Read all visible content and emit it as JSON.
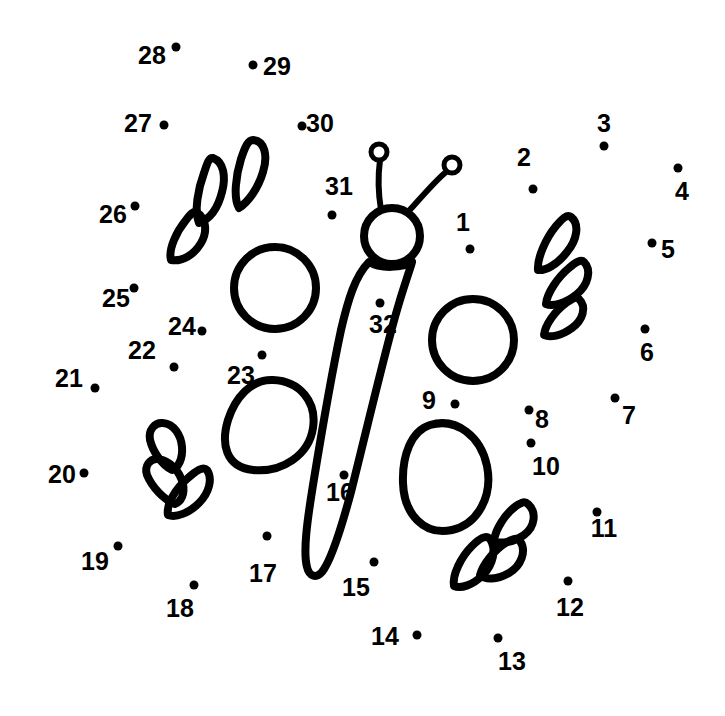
{
  "page": {
    "background_color": "#ffffff",
    "ink_color": "#000000",
    "width": 725,
    "height": 716
  },
  "puzzle": {
    "type": "connect-the-dots",
    "subject": "butterfly",
    "dot_count": 32,
    "dot_radius": 4.5,
    "label_font_size": 25,
    "dots": [
      {
        "n": "1",
        "dx": 470,
        "dy": 249,
        "lx": 463,
        "ly": 222
      },
      {
        "n": "2",
        "dx": 533,
        "dy": 189,
        "lx": 524,
        "ly": 157
      },
      {
        "n": "3",
        "dx": 604,
        "dy": 146,
        "lx": 604,
        "ly": 123
      },
      {
        "n": "4",
        "dx": 678,
        "dy": 168,
        "lx": 682,
        "ly": 191
      },
      {
        "n": "5",
        "dx": 652,
        "dy": 243,
        "lx": 668,
        "ly": 249
      },
      {
        "n": "6",
        "dx": 645,
        "dy": 329,
        "lx": 647,
        "ly": 352
      },
      {
        "n": "7",
        "dx": 615,
        "dy": 398,
        "lx": 629,
        "ly": 415
      },
      {
        "n": "8",
        "dx": 529,
        "dy": 410,
        "lx": 542,
        "ly": 419
      },
      {
        "n": "9",
        "dx": 455,
        "dy": 404,
        "lx": 429,
        "ly": 400
      },
      {
        "n": "10",
        "dx": 531,
        "dy": 443,
        "lx": 546,
        "ly": 466
      },
      {
        "n": "11",
        "dx": 597,
        "dy": 512,
        "lx": 604,
        "ly": 528
      },
      {
        "n": "12",
        "dx": 568,
        "dy": 581,
        "lx": 570,
        "ly": 607
      },
      {
        "n": "13",
        "dx": 498,
        "dy": 638,
        "lx": 512,
        "ly": 661
      },
      {
        "n": "14",
        "dx": 417,
        "dy": 635,
        "lx": 385,
        "ly": 636
      },
      {
        "n": "15",
        "dx": 374,
        "dy": 562,
        "lx": 356,
        "ly": 587
      },
      {
        "n": "16",
        "dx": 344,
        "dy": 475,
        "lx": 340,
        "ly": 492
      },
      {
        "n": "17",
        "dx": 267,
        "dy": 536,
        "lx": 263,
        "ly": 573
      },
      {
        "n": "18",
        "dx": 194,
        "dy": 585,
        "lx": 180,
        "ly": 608
      },
      {
        "n": "19",
        "dx": 118,
        "dy": 546,
        "lx": 95,
        "ly": 561
      },
      {
        "n": "20",
        "dx": 84,
        "dy": 473,
        "lx": 62,
        "ly": 474
      },
      {
        "n": "21",
        "dx": 95,
        "dy": 388,
        "lx": 69,
        "ly": 378
      },
      {
        "n": "22",
        "dx": 174,
        "dy": 367,
        "lx": 142,
        "ly": 350
      },
      {
        "n": "23",
        "dx": 262,
        "dy": 355,
        "lx": 241,
        "ly": 375
      },
      {
        "n": "24",
        "dx": 202,
        "dy": 331,
        "lx": 182,
        "ly": 326
      },
      {
        "n": "25",
        "dx": 134,
        "dy": 288,
        "lx": 116,
        "ly": 298
      },
      {
        "n": "26",
        "dx": 135,
        "dy": 206,
        "lx": 113,
        "ly": 214
      },
      {
        "n": "27",
        "dx": 164,
        "dy": 125,
        "lx": 138,
        "ly": 123
      },
      {
        "n": "28",
        "dx": 176,
        "dy": 47,
        "lx": 152,
        "ly": 55
      },
      {
        "n": "29",
        "dx": 253,
        "dy": 65,
        "lx": 277,
        "ly": 66
      },
      {
        "n": "30",
        "dx": 302,
        "dy": 126,
        "lx": 320,
        "ly": 123
      },
      {
        "n": "31",
        "dx": 332,
        "dy": 215,
        "lx": 339,
        "ly": 186
      },
      {
        "n": "32",
        "dx": 380,
        "dy": 303,
        "lx": 383,
        "ly": 324
      }
    ],
    "artwork": {
      "head": {
        "cx": 392,
        "cy": 236,
        "r": 28
      },
      "antenna_tips": [
        {
          "cx": 379,
          "cy": 152,
          "r": 7
        },
        {
          "cx": 452,
          "cy": 165,
          "r": 7
        }
      ],
      "wings": [
        {
          "name": "upper-left-circle-wing",
          "shape": "circle"
        },
        {
          "name": "lower-left-oval-wing",
          "shape": "oval"
        },
        {
          "name": "upper-right-circle-wing",
          "shape": "circle"
        },
        {
          "name": "lower-right-oval-wing",
          "shape": "oval"
        }
      ],
      "petal_clusters": [
        {
          "name": "upper-left-petals",
          "count": 3
        },
        {
          "name": "upper-right-petals",
          "count": 3
        },
        {
          "name": "lower-left-petals",
          "count": 3
        },
        {
          "name": "lower-right-petals",
          "count": 3
        }
      ],
      "body": {
        "name": "butterfly-body",
        "shape": "tapered-teardrop"
      }
    }
  }
}
